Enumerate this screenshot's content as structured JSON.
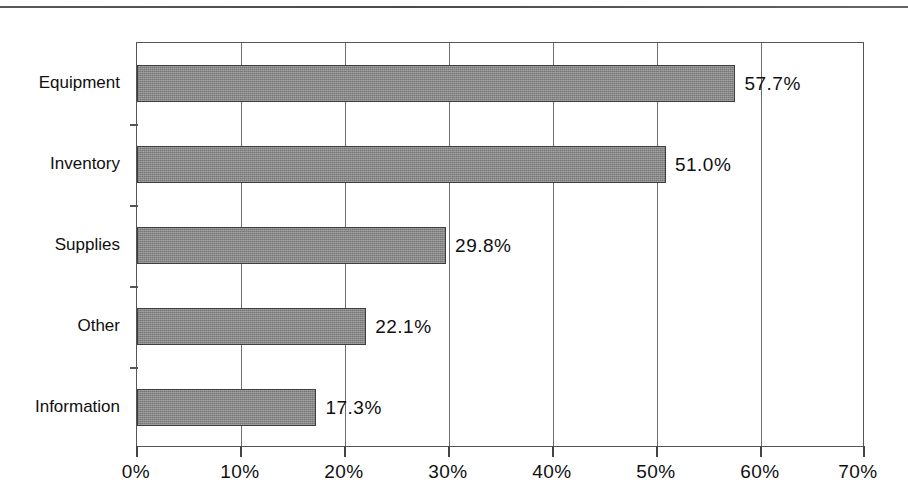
{
  "chart_data": {
    "type": "bar",
    "orientation": "horizontal",
    "title": "",
    "xlabel": "",
    "ylabel": "",
    "categories": [
      "Equipment",
      "Inventory",
      "Supplies",
      "Other",
      "Information"
    ],
    "values": [
      57.7,
      51.0,
      29.8,
      22.1,
      17.3
    ],
    "value_labels": [
      "57.7%",
      "51.0%",
      "29.8%",
      "22.1%",
      "17.3%"
    ],
    "xlim": [
      0,
      70
    ],
    "xticks": [
      0,
      10,
      20,
      30,
      40,
      50,
      60,
      70
    ],
    "xtick_labels": [
      "0%",
      "10%",
      "20%",
      "30%",
      "40%",
      "50%",
      "60%",
      "70%"
    ],
    "grid": "vertical",
    "legend": null,
    "bar_color": "#888888",
    "bar_edge_color": "#3f3f3f",
    "axis_color": "#555555",
    "background": "#ffffff"
  }
}
